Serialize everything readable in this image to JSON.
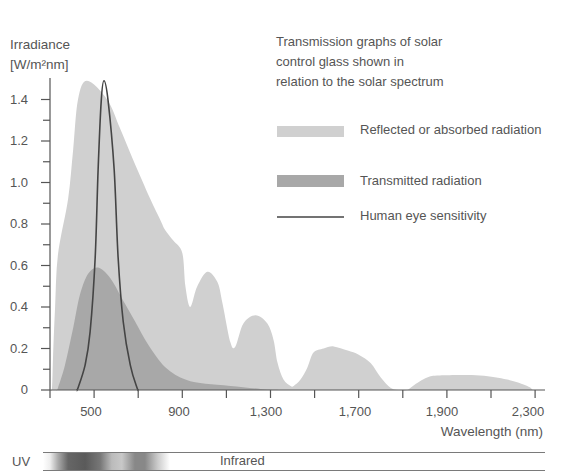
{
  "chart_data": {
    "type": "area",
    "title_lines": [
      "Transmission graphs of solar",
      "control glass shown in",
      "relation to the solar spectrum"
    ],
    "ylabel": "Irradiance [W/m²nm]",
    "ylabel_lines": [
      "Irradiance",
      "[W/m²nm]"
    ],
    "xlabel": "Wavelength (nm)",
    "ylim": [
      0,
      1.5
    ],
    "grid": false,
    "legend_position": "upper right",
    "y_ticks": [
      {
        "value": 0,
        "label": "0"
      },
      {
        "value": 0.2,
        "label": "0.2"
      },
      {
        "value": 0.4,
        "label": "0.4"
      },
      {
        "value": 0.6,
        "label": "0.6"
      },
      {
        "value": 0.8,
        "label": "0.8"
      },
      {
        "value": 1.0,
        "label": "1.0"
      },
      {
        "value": 1.2,
        "label": "1.2"
      },
      {
        "value": 1.4,
        "label": "1.4"
      }
    ],
    "y_minor_ticks": [
      0.1,
      0.3,
      0.5,
      0.7,
      0.9,
      1.1,
      1.3
    ],
    "x_ticks": [
      300,
      500,
      700,
      900,
      1100,
      1300,
      1500,
      1700,
      1800,
      1900,
      2100,
      2300
    ],
    "x_tick_labels": [
      {
        "value": 500,
        "label": "500"
      },
      {
        "value": 900,
        "label": "900"
      },
      {
        "value": 1300,
        "label": "1,300"
      },
      {
        "value": 1700,
        "label": "1,700"
      },
      {
        "value": 1900,
        "label": "1,900"
      },
      {
        "value": 2300,
        "label": "2,300"
      }
    ],
    "series": [
      {
        "name": "Reflected or absorbed radiation",
        "type": "area",
        "color": "#d0d0d0",
        "points": [
          [
            300,
            0
          ],
          [
            309,
            0.01
          ],
          [
            314,
            0.17
          ],
          [
            323,
            0.4
          ],
          [
            336,
            0.65
          ],
          [
            382,
            0.92
          ],
          [
            405,
            1.16
          ],
          [
            427,
            1.4
          ],
          [
            468,
            1.49
          ],
          [
            559,
            1.4
          ],
          [
            618,
            1.26
          ],
          [
            677,
            1.11
          ],
          [
            755,
            0.92
          ],
          [
            800,
            0.82
          ],
          [
            823,
            0.77
          ],
          [
            859,
            0.72
          ],
          [
            900,
            0.66
          ],
          [
            914,
            0.5
          ],
          [
            936,
            0.4
          ],
          [
            968,
            0.5
          ],
          [
            1014,
            0.57
          ],
          [
            1059,
            0.52
          ],
          [
            1082,
            0.42
          ],
          [
            1118,
            0.23
          ],
          [
            1141,
            0.21
          ],
          [
            1177,
            0.32
          ],
          [
            1232,
            0.36
          ],
          [
            1286,
            0.32
          ],
          [
            1314,
            0.24
          ],
          [
            1332,
            0.13
          ],
          [
            1359,
            0.05
          ],
          [
            1391,
            0.02
          ],
          [
            1405,
            0.02
          ],
          [
            1436,
            0.05
          ],
          [
            1468,
            0.11
          ],
          [
            1495,
            0.18
          ],
          [
            1541,
            0.2
          ],
          [
            1586,
            0.21
          ],
          [
            1650,
            0.19
          ],
          [
            1700,
            0.17
          ],
          [
            1727,
            0.13
          ],
          [
            1750,
            0.06
          ],
          [
            1773,
            0.01
          ],
          [
            1795,
            0
          ],
          [
            1810,
            0
          ],
          [
            1823,
            0.02
          ],
          [
            1855,
            0.06
          ],
          [
            1884,
            0.07
          ],
          [
            2050,
            0.07
          ],
          [
            2173,
            0.05
          ],
          [
            2264,
            0.02
          ],
          [
            2290,
            0
          ]
        ]
      },
      {
        "name": "Transmitted radiation",
        "type": "area",
        "color": "#a8a8a8",
        "points": [
          [
            330,
            0
          ],
          [
            336,
            0.01
          ],
          [
            368,
            0.12
          ],
          [
            405,
            0.3
          ],
          [
            436,
            0.46
          ],
          [
            473,
            0.56
          ],
          [
            518,
            0.59
          ],
          [
            573,
            0.54
          ],
          [
            627,
            0.44
          ],
          [
            686,
            0.33
          ],
          [
            745,
            0.22
          ],
          [
            823,
            0.11
          ],
          [
            914,
            0.05
          ],
          [
            1005,
            0.03
          ],
          [
            1118,
            0.02
          ],
          [
            1255,
            0.005
          ],
          [
            1345,
            0
          ]
        ]
      },
      {
        "name": "Human eye sensitivity",
        "type": "line",
        "color": "#444444",
        "points": [
          [
            420,
            0
          ],
          [
            427,
            0.01
          ],
          [
            459,
            0.12
          ],
          [
            482,
            0.28
          ],
          [
            505,
            0.64
          ],
          [
            518,
            1.06
          ],
          [
            532,
            1.39
          ],
          [
            545,
            1.49
          ],
          [
            564,
            1.39
          ],
          [
            591,
            1.06
          ],
          [
            609,
            0.64
          ],
          [
            632,
            0.33
          ],
          [
            664,
            0.12
          ],
          [
            695,
            0.01
          ],
          [
            702,
            0
          ]
        ]
      }
    ]
  },
  "spectrum_bar": {
    "uv_label": "UV",
    "infrared_label": "Infrared"
  }
}
